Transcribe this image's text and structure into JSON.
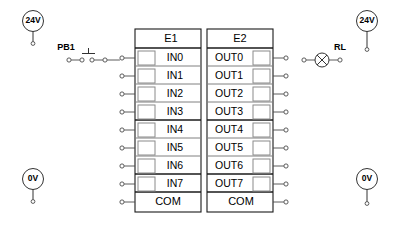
{
  "diagram": {
    "background_color": "#ffffff",
    "line_color": "#333333"
  },
  "modules": [
    {
      "id": "E1",
      "header_label": "E1",
      "kind": "input-module",
      "terminal_side": "left",
      "common_label": "COM",
      "channels": [
        {
          "label": "IN0"
        },
        {
          "label": "IN1"
        },
        {
          "label": "IN2"
        },
        {
          "label": "IN3"
        },
        {
          "label": "IN4"
        },
        {
          "label": "IN5"
        },
        {
          "label": "IN6"
        },
        {
          "label": "IN7"
        }
      ]
    },
    {
      "id": "E2",
      "header_label": "E2",
      "kind": "output-module",
      "terminal_side": "right",
      "common_label": "COM",
      "channels": [
        {
          "label": "OUT0"
        },
        {
          "label": "OUT1"
        },
        {
          "label": "OUT2"
        },
        {
          "label": "OUT3"
        },
        {
          "label": "OUT4"
        },
        {
          "label": "OUT5"
        },
        {
          "label": "OUT6"
        },
        {
          "label": "OUT7"
        }
      ]
    }
  ],
  "supplies": [
    {
      "name": "supply-24v-left",
      "label": "24V",
      "position": "top-left"
    },
    {
      "name": "supply-24v-right",
      "label": "24V",
      "position": "top-right"
    },
    {
      "name": "supply-0v-left",
      "label": "0V",
      "position": "bottom-left"
    },
    {
      "name": "supply-0v-right",
      "label": "0V",
      "position": "bottom-right"
    }
  ],
  "devices": [
    {
      "name": "push-button",
      "label": "PB1",
      "symbol": "push-button-no",
      "connected_to": "IN0"
    },
    {
      "name": "lamp",
      "label": "RL",
      "symbol": "lamp",
      "connected_to": "OUT0"
    }
  ]
}
